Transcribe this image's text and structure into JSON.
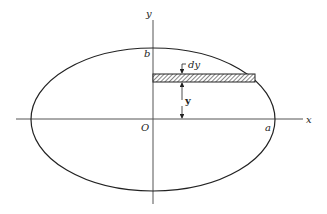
{
  "diagram": {
    "type": "ellipse-area-element",
    "labels": {
      "x_axis": "x",
      "y_axis": "y",
      "origin": "O",
      "semi_major": "a",
      "semi_minor": "b",
      "strip_thickness": "dy",
      "strip_height": "y"
    },
    "colors": {
      "stroke": "#222222",
      "axis": "#555555",
      "background": "#ffffff"
    }
  }
}
